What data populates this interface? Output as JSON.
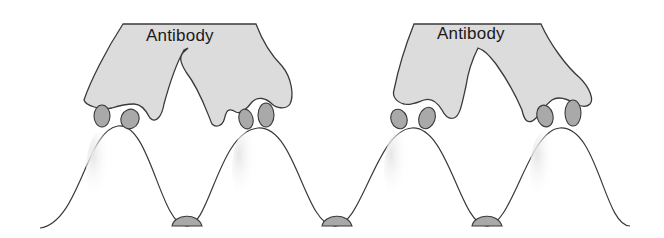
{
  "diagram": {
    "type": "antibody-antigen binding illustration",
    "labels": [
      {
        "id": "antibody-1",
        "text": "Antibody"
      },
      {
        "id": "antibody-2",
        "text": "Antibody"
      }
    ],
    "colors": {
      "antibody_fill": "#dcdcdc",
      "epitope_fill": "#a9a9a9",
      "outline": "#3a3a3a",
      "surface_fill": "#ffffff",
      "background": "#ffffff"
    },
    "elements": {
      "antibodies": 2,
      "surface_peaks": 4,
      "bound_epitopes": 8,
      "unbound_epitopes_in_valleys": 3
    }
  }
}
